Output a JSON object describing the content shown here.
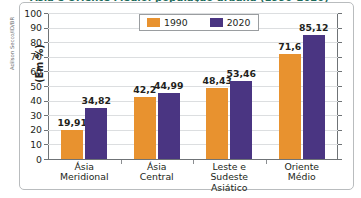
{
  "credit": "Adilson Secco/ID/BR",
  "figure": {
    "title_cut": "Ásia e Oriente Médio: população urbana (1990-2020)"
  },
  "legend": {
    "position": "top-center",
    "entries": [
      {
        "label": "1990",
        "color": "#e8922f"
      },
      {
        "label": "2020",
        "color": "#4a3582"
      }
    ]
  },
  "axis": {
    "y_title": "(Em %)",
    "y_ticks": [
      "100",
      "90",
      "80",
      "70",
      "60",
      "50",
      "40",
      "30",
      "20",
      "10",
      "0"
    ]
  },
  "chart_data": {
    "type": "bar",
    "title": "Ásia e Oriente Médio: população urbana (1990-2020)",
    "xlabel": "",
    "ylabel": "(Em %)",
    "ylim": [
      0,
      100
    ],
    "ytick_step": 10,
    "grid": true,
    "legend_position": "top-center",
    "categories": [
      "Ásia Meridional",
      "Ásia Central",
      "Leste e Sudeste Asiático",
      "Oriente Médio"
    ],
    "category_lines": [
      [
        "Ásia",
        "Meridional"
      ],
      [
        "Ásia",
        "Central"
      ],
      [
        "Leste e Sudeste",
        "Asiático"
      ],
      [
        "Oriente",
        "Médio"
      ]
    ],
    "series": [
      {
        "name": "1990",
        "color": "#e8922f",
        "values": [
          19.91,
          42.2,
          48.43,
          71.6
        ],
        "labels": [
          "19,91",
          "42,2",
          "48,43",
          "71,6"
        ]
      },
      {
        "name": "2020",
        "color": "#4a3582",
        "values": [
          34.82,
          44.99,
          53.46,
          85.12
        ],
        "labels": [
          "34,82",
          "44,99",
          "53,46",
          "85,12"
        ]
      }
    ]
  }
}
